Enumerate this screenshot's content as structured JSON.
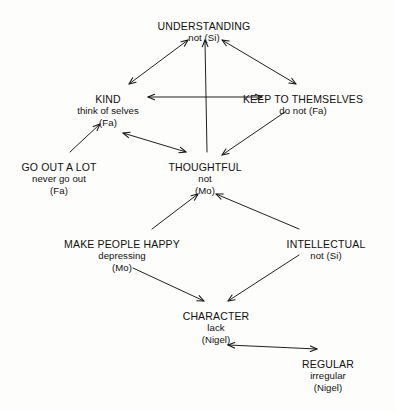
{
  "diagram": {
    "type": "directed-graph",
    "title_visible": false,
    "background_color": "#fdfdfb",
    "line_color": "#141414",
    "nodes": [
      {
        "id": "understanding",
        "line1": "UNDERSTANDING",
        "line2": "not (Si)",
        "line3": "",
        "x": 204,
        "y": 20
      },
      {
        "id": "kind",
        "line1": "KIND",
        "line2": "think of selves",
        "line3": "(Fa)",
        "x": 108,
        "y": 93
      },
      {
        "id": "keep-to-themselves",
        "line1": "KEEP TO THEMSELVES",
        "line2": "do not (Fa)",
        "line3": "",
        "x": 303,
        "y": 93
      },
      {
        "id": "go-out-a-lot",
        "line1": "GO OUT A LOT",
        "line2": "never go out",
        "line3": "(Fa)",
        "x": 59,
        "y": 161
      },
      {
        "id": "thoughtful",
        "line1": "THOUGHTFUL",
        "line2": "not",
        "line3": "(Mo)",
        "x": 205,
        "y": 161
      },
      {
        "id": "make-people-happy",
        "line1": "MAKE PEOPLE HAPPY",
        "line2": "depressing",
        "line3": "(Mo)",
        "x": 122,
        "y": 238
      },
      {
        "id": "intellectual",
        "line1": "INTELLECTUAL",
        "line2": "not (Si)",
        "line3": "",
        "x": 326,
        "y": 238
      },
      {
        "id": "character",
        "line1": "CHARACTER",
        "line2": "lack",
        "line3": "(Nigel)",
        "x": 216,
        "y": 310
      },
      {
        "id": "regular",
        "line1": "REGULAR",
        "line2": "irregular",
        "line3": "(Nigel)",
        "x": 328,
        "y": 358
      }
    ],
    "edges": [
      {
        "from": "kind",
        "to": "understanding",
        "direction": "both",
        "x1": 129,
        "y1": 84,
        "x2": 188,
        "y2": 40
      },
      {
        "from": "keep-to-themselves",
        "to": "understanding",
        "direction": "both",
        "x1": 296,
        "y1": 84,
        "x2": 222,
        "y2": 40
      },
      {
        "from": "thoughtful",
        "to": "understanding",
        "direction": "forward",
        "x1": 207,
        "y1": 152,
        "x2": 205,
        "y2": 40
      },
      {
        "from": "kind",
        "to": "keep-to-themselves",
        "direction": "both",
        "x1": 148,
        "y1": 97,
        "x2": 262,
        "y2": 97
      },
      {
        "from": "go-out-a-lot",
        "to": "kind",
        "direction": "forward",
        "x1": 70,
        "y1": 152,
        "x2": 100,
        "y2": 124
      },
      {
        "from": "kind",
        "to": "thoughtful",
        "direction": "both",
        "x1": 123,
        "y1": 133,
        "x2": 186,
        "y2": 152
      },
      {
        "from": "keep-to-themselves",
        "to": "thoughtful",
        "direction": "forward",
        "x1": 285,
        "y1": 112,
        "x2": 222,
        "y2": 155
      },
      {
        "from": "make-people-happy",
        "to": "thoughtful",
        "direction": "forward",
        "x1": 152,
        "y1": 229,
        "x2": 198,
        "y2": 194
      },
      {
        "from": "intellectual",
        "to": "thoughtful",
        "direction": "forward",
        "x1": 299,
        "y1": 229,
        "x2": 216,
        "y2": 194
      },
      {
        "from": "make-people-happy",
        "to": "character",
        "direction": "forward",
        "x1": 133,
        "y1": 268,
        "x2": 204,
        "y2": 301
      },
      {
        "from": "intellectual",
        "to": "character",
        "direction": "forward",
        "x1": 299,
        "y1": 255,
        "x2": 228,
        "y2": 301
      },
      {
        "from": "character",
        "to": "regular",
        "direction": "both",
        "x1": 228,
        "y1": 345,
        "x2": 317,
        "y2": 349
      }
    ]
  }
}
